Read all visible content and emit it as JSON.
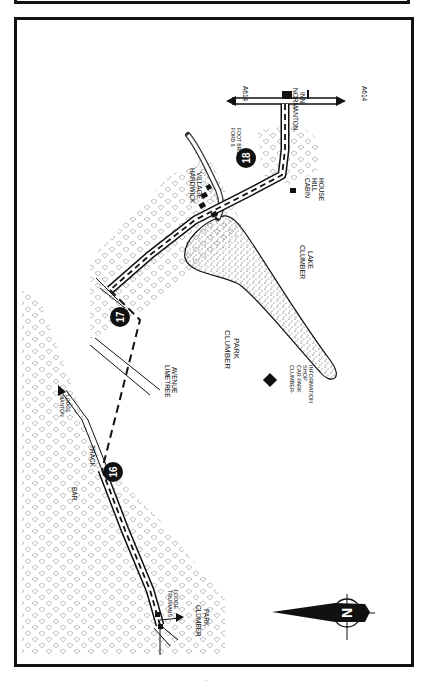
{
  "map": {
    "title": "Clumber Park walk route",
    "stage_markers": [
      {
        "id": "16",
        "label": "16"
      },
      {
        "id": "17",
        "label": "17"
      },
      {
        "id": "18",
        "label": "18"
      }
    ],
    "labels": {
      "normanton_inn": [
        "NORMANTON",
        "INN"
      ],
      "a614_north": "A614",
      "a614_south": "A614",
      "cabin_hill_house": [
        "CABIN",
        "HILL",
        "HOUSE"
      ],
      "ford_footbridge": [
        "FORD &",
        "FOOT BRIDGE"
      ],
      "hardwick_village": [
        "HARDWICK",
        "VILLAGE"
      ],
      "clumber_lake": [
        "CLUMBER",
        "LAKE"
      ],
      "clumber_park": [
        "CLUMBER",
        "PARK"
      ],
      "limetree_avenue": [
        "LIMETREE",
        "AVENUE"
      ],
      "car_park": [
        "CLUMBER-",
        "CAR PARK",
        "SHOP",
        "INFORMATION"
      ],
      "manton_lodge": [
        "MANTON",
        "LODGE"
      ],
      "track": "TRACK",
      "bar": "BAR",
      "trumans_lodge": [
        "TRUMANS",
        "LODGE"
      ],
      "clumber_park_exit": [
        "CLUMBER",
        "PARK"
      ]
    },
    "compass": {
      "letter": "N",
      "icon": "north-arrow-icon"
    },
    "colors": {
      "ink": "#111111",
      "paper": "#ffffff",
      "woodland": "#b5b5b5",
      "lake_speckle": "#333333"
    }
  }
}
